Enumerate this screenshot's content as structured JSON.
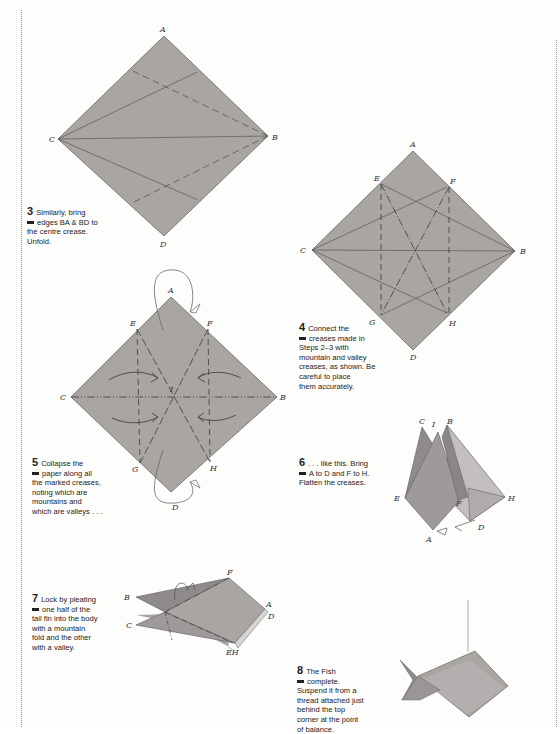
{
  "page": {
    "paper_color": "#a9a5a3",
    "line_color": "#5a5657"
  },
  "steps": [
    {
      "number": "3",
      "line1": "Similarly, bring",
      "line2": "edges BA & BD to",
      "rest": [
        "the centre crease.",
        "Unfold."
      ],
      "labels": {
        "A": "A",
        "B": "B",
        "C": "C",
        "D": "D"
      }
    },
    {
      "number": "4",
      "line1": "Connect the",
      "line2": "creases made in",
      "rest": [
        "Steps 2–3 with",
        "mountain and valley",
        "creases, as shown. Be",
        "careful to place",
        "them accurately."
      ],
      "labels": {
        "A": "A",
        "B": "B",
        "C": "C",
        "D": "D",
        "E": "E",
        "F": "F",
        "G": "G",
        "H": "H"
      }
    },
    {
      "number": "5",
      "line1": "Collapse the",
      "line2": "paper along all",
      "rest": [
        "the marked creases,",
        "noting which are",
        "mountains and",
        "which are valleys . . ."
      ],
      "labels": {
        "A": "A",
        "B": "B",
        "C": "C",
        "D": "D",
        "E": "E",
        "F": "F",
        "G": "G",
        "H": "H",
        "I": "I"
      }
    },
    {
      "number": "6",
      "line1": ". . . like this. Bring",
      "line2": "A to D and F to H.",
      "rest": [
        "Flatten the creases."
      ],
      "labels": {
        "A": "A",
        "B": "B",
        "C": "C",
        "D": "D",
        "E": "E",
        "F": "F",
        "H": "H",
        "I": "I"
      }
    },
    {
      "number": "7",
      "line1": "Lock by pleating",
      "line2": "one half of the",
      "rest": [
        "tail fin into the body",
        "with a mountain",
        "fold and the other",
        "with a valley."
      ],
      "labels": {
        "A": "A",
        "B": "B",
        "C": "C",
        "D": "D",
        "EH": "EH",
        "F": "F"
      }
    },
    {
      "number": "8",
      "line1": "The Fish",
      "line2": "complete.",
      "rest": [
        "Suspend it from a",
        "thread attached just",
        "behind the top",
        "corner at the point",
        "of balance."
      ]
    }
  ]
}
